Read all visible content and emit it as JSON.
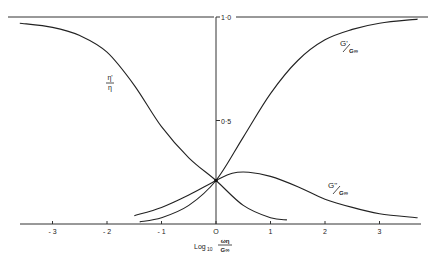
{
  "chart_data": {
    "type": "line",
    "title": "",
    "xlabel": "Log10 ωη/G∞",
    "ylabel": "",
    "xlim": [
      -3.6,
      3.8
    ],
    "ylim": [
      0,
      1.0
    ],
    "grid": false,
    "x_ticks": [
      "-3",
      "-2",
      "-1",
      "0",
      "1",
      "2",
      "3"
    ],
    "y_ticks": [
      "0.5",
      "1.0"
    ],
    "y_tick_labels": [
      "0·5",
      "1·0"
    ],
    "series": [
      {
        "name": "η'/η",
        "label": "η'/η",
        "x": [
          -3.6,
          -3.0,
          -2.5,
          -2.0,
          -1.5,
          -1.0,
          -0.5,
          0.0,
          0.5,
          1.0,
          1.3
        ],
        "values": [
          0.97,
          0.95,
          0.91,
          0.83,
          0.67,
          0.47,
          0.32,
          0.21,
          0.09,
          0.03,
          0.02
        ]
      },
      {
        "name": "G'/G∞",
        "label": "G'/G∞",
        "x": [
          -1.4,
          -1.0,
          -0.5,
          0.0,
          0.5,
          1.0,
          1.5,
          2.0,
          2.5,
          3.0,
          3.7
        ],
        "values": [
          0.01,
          0.03,
          0.09,
          0.21,
          0.42,
          0.63,
          0.79,
          0.89,
          0.94,
          0.97,
          0.99
        ]
      },
      {
        "name": "G''/G∞",
        "label": "G''/G∞",
        "x": [
          -1.5,
          -1.0,
          -0.5,
          0.0,
          0.3,
          0.6,
          1.0,
          1.5,
          2.0,
          2.5,
          3.0,
          3.7
        ],
        "values": [
          0.04,
          0.08,
          0.14,
          0.21,
          0.245,
          0.25,
          0.23,
          0.18,
          0.12,
          0.08,
          0.05,
          0.03
        ]
      }
    ],
    "annotations": [
      {
        "text": "η'/η",
        "x": -2.0,
        "y": 0.7
      },
      {
        "text": "G'/G∞",
        "x": 2.7,
        "y": 0.85
      },
      {
        "text": "G''/G∞",
        "x": 2.5,
        "y": 0.25
      }
    ],
    "reference_lines": [
      {
        "type": "horizontal",
        "y": 1.0
      },
      {
        "type": "horizontal",
        "y": 0.0
      },
      {
        "type": "vertical",
        "x": 0.0
      }
    ],
    "intersection_point": {
      "x": 0.0,
      "y": 0.21
    }
  },
  "labels": {
    "x_axis_prefix": "Log",
    "x_axis_sub": "10",
    "x_axis_num": "ωη",
    "x_axis_den": "G∞",
    "eta_num": "η'",
    "eta_den": "η",
    "gprime_num": "G'",
    "gprime_den": "G∞",
    "gdouble_num": "G''",
    "gdouble_den": "G∞"
  }
}
